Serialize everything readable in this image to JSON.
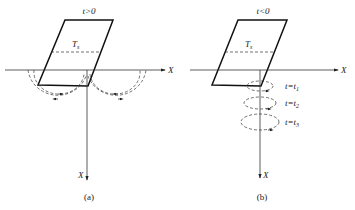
{
  "panels": [
    {
      "caption": "(a)",
      "condition": "t>0",
      "region_label": "T",
      "region_sub": "s",
      "axis_h_label": "X",
      "axis_v_label": "X",
      "flow_pattern": "two counter-rotating semicircular loops at surface"
    },
    {
      "caption": "(b)",
      "condition": "t<0",
      "region_label": "T",
      "region_sub": "s",
      "axis_h_label": "X",
      "axis_v_label": "X",
      "flow_pattern": "stacked horizontal ellipses along vertical axis",
      "time_labels": [
        {
          "t": "t=t",
          "sub": "1"
        },
        {
          "t": "t=t",
          "sub": "2"
        },
        {
          "t": "t=t",
          "sub": "3"
        }
      ]
    }
  ]
}
